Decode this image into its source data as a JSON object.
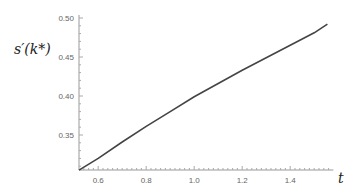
{
  "chart_data": {
    "type": "line",
    "title": "",
    "xlabel": "t",
    "ylabel": "s′(k*)",
    "xlim": [
      0.52,
      1.58
    ],
    "ylim": [
      0.302,
      0.5
    ],
    "grid": false,
    "legend": null,
    "x_ticks": [
      "0.6",
      "0.8",
      "1.0",
      "1.2",
      "1.4"
    ],
    "y_ticks": [
      "0.35",
      "0.40",
      "0.45",
      "0.50"
    ],
    "series": [
      {
        "name": "s'(k*)",
        "color": "#444444",
        "x": [
          0.52,
          0.6,
          0.7,
          0.8,
          0.9,
          1.0,
          1.1,
          1.2,
          1.3,
          1.4,
          1.5,
          1.555
        ],
        "y": [
          0.305,
          0.32,
          0.341,
          0.361,
          0.38,
          0.399,
          0.416,
          0.433,
          0.449,
          0.465,
          0.481,
          0.492
        ]
      }
    ]
  },
  "axes": {
    "ylabel": "s′(k*)",
    "xlabel": "t"
  }
}
